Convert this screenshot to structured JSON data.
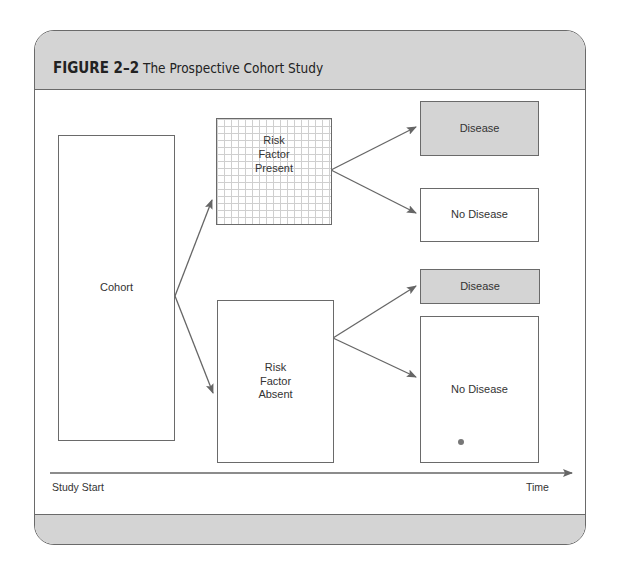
{
  "figure": {
    "label": "FIGURE 2–2",
    "title": "The Prospective Cohort Study"
  },
  "nodes": {
    "cohort": "Cohort",
    "risk_present": "Risk\nFactor\nPresent",
    "risk_absent": "Risk\nFactor\nAbsent",
    "present_disease": "Disease",
    "present_no_disease": "No Disease",
    "absent_disease": "Disease",
    "absent_no_disease": "No Disease"
  },
  "axis": {
    "start_label": "Study Start",
    "end_label": "Time"
  },
  "colors": {
    "border": "#6a6a6a",
    "shaded": "#d4d4d4",
    "arrow": "#666666"
  }
}
